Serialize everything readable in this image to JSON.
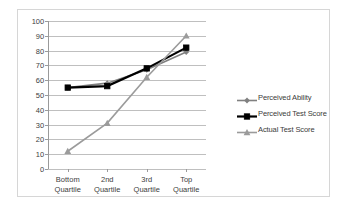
{
  "chart_data": {
    "type": "line",
    "title": "",
    "xlabel": "",
    "ylabel": "",
    "categories": [
      "Bottom Quartile",
      "2nd Quartile",
      "3rd Quartile",
      "Top Quartile"
    ],
    "category_lines": [
      [
        "Bottom",
        "Quartile"
      ],
      [
        "2nd",
        "Quartile"
      ],
      [
        "3rd",
        "Quartile"
      ],
      [
        "Top",
        "Quartile"
      ]
    ],
    "ylim": [
      0,
      100
    ],
    "ytick_step": 10,
    "yticks": [
      "100",
      "90",
      "80",
      "70",
      "60",
      "50",
      "40",
      "30",
      "20",
      "10",
      "0"
    ],
    "grid": "horizontal",
    "legend_position": "right",
    "series": [
      {
        "name": "Perceived Ability",
        "values": [
          55,
          58,
          67,
          79
        ],
        "color": "#808080",
        "marker": "diamond",
        "line_width": 1.6
      },
      {
        "name": "Perceived Test Score",
        "values": [
          55,
          56,
          68,
          82
        ],
        "color": "#000000",
        "marker": "square",
        "line_width": 2.2
      },
      {
        "name": "Actual Test Score",
        "values": [
          12,
          31,
          62,
          90
        ],
        "color": "#9b9b9b",
        "marker": "triangle",
        "line_width": 1.6
      }
    ]
  },
  "colors": {
    "grid": "#bfbfbf",
    "axis": "#9a9a9a",
    "frame_border": "#d6d6d6",
    "text": "#404040",
    "background": "#ffffff"
  }
}
